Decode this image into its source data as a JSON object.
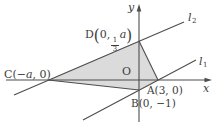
{
  "figure": {
    "ink": "#4d4d4d",
    "fill": "#dbdbdb",
    "background": "#ffffff"
  },
  "axes": {
    "x_label": "x",
    "y_label": "y",
    "origin_label": "O"
  },
  "lines": {
    "l1": {
      "base": "l",
      "sub": "1"
    },
    "l2": {
      "base": "l",
      "sub": "2"
    }
  },
  "points": {
    "A": {
      "label": "A(3, 0)"
    },
    "B": {
      "label": "B(0, −1)"
    },
    "C": {
      "pre": "C(−",
      "var": "a",
      "post": ", 0)"
    },
    "D": {
      "point": "D",
      "open": "(",
      "pre": "0,",
      "frac_num": "1",
      "frac_den": "3",
      "var": "a",
      "close": ")"
    }
  }
}
